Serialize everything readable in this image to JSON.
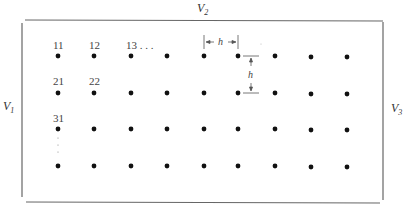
{
  "diagram": {
    "boundaries": {
      "top": {
        "label": "V",
        "subscript": "2"
      },
      "left": {
        "label": "V",
        "subscript": "1"
      },
      "right": {
        "label": "V",
        "subscript": "3"
      }
    },
    "grid": {
      "rows": 4,
      "cols": 9,
      "col_x": [
        58,
        94,
        131,
        167,
        204,
        238,
        275,
        311,
        347
      ],
      "row_y": [
        56,
        93,
        129,
        166
      ]
    },
    "node_labels": [
      {
        "text": "11",
        "row": 0,
        "col": 0
      },
      {
        "text": "12",
        "row": 0,
        "col": 1
      },
      {
        "text": "13 . . .",
        "row": 0,
        "col": 2
      },
      {
        "text": "21",
        "row": 1,
        "col": 0
      },
      {
        "text": "22",
        "row": 1,
        "col": 1
      },
      {
        "text": "31",
        "row": 2,
        "col": 0
      }
    ],
    "spacing": {
      "horizontal_label": "h",
      "vertical_label": "h"
    },
    "colors": {
      "dot": "#111111",
      "line": "#555555"
    }
  }
}
